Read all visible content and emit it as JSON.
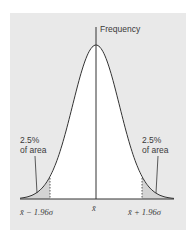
{
  "chart_data": {
    "type": "area",
    "distribution": "normal",
    "ylabel": "Frequency",
    "xlabel": "",
    "x_ticks": [
      "x̄ − 1.96σ",
      "x̄",
      "x̄ + 1.96σ"
    ],
    "x_tick_values_in_sigma": [
      -1.96,
      0,
      1.96
    ],
    "annotations": [
      {
        "text": "2.5% of area",
        "region": "left tail",
        "x_range_sigma": [
          -3.5,
          -1.96
        ],
        "area_pct": 2.5
      },
      {
        "text": "2.5% of area",
        "region": "right tail",
        "x_range_sigma": [
          1.96,
          3.5
        ],
        "area_pct": 2.5
      }
    ],
    "central_area_pct": 95,
    "shaded_regions": [
      "tails beyond ±1.96σ"
    ],
    "colors": {
      "panel": "#e9e9e9",
      "central_fill": "#ffffff",
      "tail_fill": "#d4d4d4",
      "curve": "#333333"
    }
  },
  "labels": {
    "frequency": "Frequency",
    "left_pct": "2.5%",
    "left_area": "of area",
    "right_pct": "2.5%",
    "right_area": "of area",
    "tick_left": "x̄ − 1.96σ",
    "tick_center": "x̄",
    "tick_right": "x̄ + 1.96σ"
  }
}
